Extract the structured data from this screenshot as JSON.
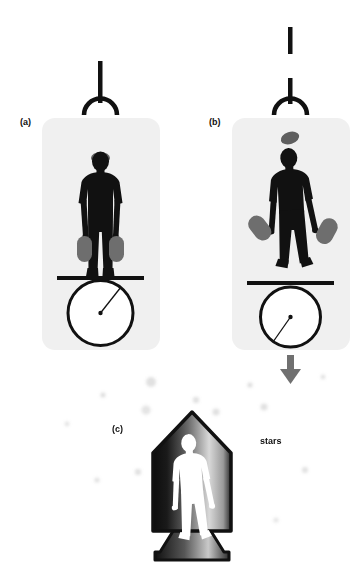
{
  "figure": {
    "title": "",
    "background_color": "#ffffff",
    "width": 360,
    "height": 578,
    "panels": [
      {
        "id": "a",
        "label": "(a)",
        "label_x": 20,
        "label_y": 118,
        "description": "person standing on a board balanced on a wheel, suspended by an intact cable and hook, holding two weights, wearing a cap",
        "panel_x": 42,
        "panel_y": 118,
        "panel_w": 118,
        "panel_h": 232,
        "panel_fill": "#f0f0f0",
        "cable_state": "intact",
        "wheel_marker_direction": "up-right",
        "weights_held": true,
        "cap_on_head": true
      },
      {
        "id": "b",
        "label": "(b)",
        "label_x": 209,
        "label_y": 118,
        "description": "person floating weightless, cable snapped above the hook, cap and weights floating freely, wheel marker rotated, downward arrow below indicating free fall",
        "panel_x": 232,
        "panel_y": 118,
        "panel_w": 118,
        "panel_h": 232,
        "panel_fill": "#f0f0f0",
        "cable_state": "broken",
        "wheel_marker_direction": "down-left",
        "weights_held": false,
        "cap_on_head": false,
        "arrow_direction": "down",
        "arrow_color": "#707070"
      },
      {
        "id": "c",
        "label": "(c)",
        "label_x": 112,
        "label_y": 425,
        "description": "rocket ship silhouette with a white human figure inside, drifting among stars in space",
        "rocket_x": 152,
        "rocket_y": 412,
        "rocket_w": 80,
        "rocket_h": 150,
        "rocket_outline_color": "#111111"
      }
    ],
    "annotations": [
      {
        "name": "stars",
        "text": "stars",
        "x": 260,
        "y": 437
      }
    ],
    "stars": [
      {
        "x": 151,
        "y": 382,
        "r": 5.0,
        "opacity": 0.3
      },
      {
        "x": 103,
        "y": 395,
        "r": 2.6,
        "opacity": 0.34
      },
      {
        "x": 250,
        "y": 385,
        "r": 2.6,
        "opacity": 0.34
      },
      {
        "x": 196,
        "y": 400,
        "r": 3.2,
        "opacity": 0.3
      },
      {
        "x": 146,
        "y": 410,
        "r": 4.6,
        "opacity": 0.26
      },
      {
        "x": 216,
        "y": 412,
        "r": 3.6,
        "opacity": 0.3
      },
      {
        "x": 264,
        "y": 407,
        "r": 3.6,
        "opacity": 0.3
      },
      {
        "x": 323,
        "y": 377,
        "r": 2.4,
        "opacity": 0.3
      },
      {
        "x": 305,
        "y": 470,
        "r": 3.0,
        "opacity": 0.3
      },
      {
        "x": 138,
        "y": 472,
        "r": 3.2,
        "opacity": 0.3
      },
      {
        "x": 97,
        "y": 480,
        "r": 2.6,
        "opacity": 0.3
      },
      {
        "x": 67,
        "y": 424,
        "r": 2.4,
        "opacity": 0.28
      },
      {
        "x": 276,
        "y": 520,
        "r": 2.6,
        "opacity": 0.26
      }
    ],
    "colors": {
      "silhouette": "#111111",
      "panel_background": "#f0f0f0",
      "weight_gray": "#6e6e6e",
      "cap_gray": "#5f5f5f",
      "arrow_gray": "#707070",
      "star_gray": "#9a9a9a",
      "page_background": "#ffffff",
      "text": "#111111"
    }
  }
}
